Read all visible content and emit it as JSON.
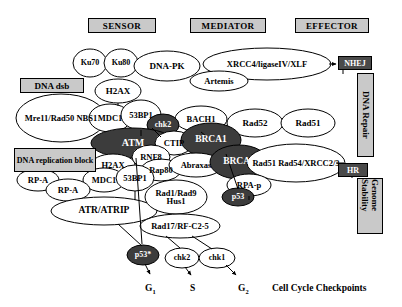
{
  "headers": [
    {
      "id": "sensor",
      "label": "SENSOR",
      "x": 88,
      "y": 18,
      "w": 68,
      "h": 15,
      "fs": 9
    },
    {
      "id": "mediator",
      "label": "MEDIATOR",
      "x": 190,
      "y": 18,
      "w": 76,
      "h": 15,
      "fs": 9
    },
    {
      "id": "effector",
      "label": "EFFECTOR",
      "x": 295,
      "y": 18,
      "w": 74,
      "h": 15,
      "fs": 9
    }
  ],
  "stimulus_boxes": [
    {
      "id": "dna-dsb",
      "label": "DNA dsb",
      "x": 20,
      "y": 78,
      "w": 64,
      "h": 15,
      "fs": 9
    },
    {
      "id": "dna-replication-block",
      "label": "DNA replication block",
      "x": 14,
      "y": 148,
      "w": 82,
      "h": 24,
      "fs": 8
    }
  ],
  "outcome_boxes": [
    {
      "id": "nhej",
      "label": "NHEJ",
      "x": 338,
      "y": 56,
      "w": 34,
      "h": 14,
      "fs": 8,
      "style": "dark"
    },
    {
      "id": "hr",
      "label": "HR",
      "x": 338,
      "y": 163,
      "w": 30,
      "h": 14,
      "fs": 8,
      "style": "dark"
    }
  ],
  "vertical_labels": [
    {
      "id": "dna-repair",
      "label": "DNA Repair",
      "x": 357,
      "y": 73,
      "w": 17,
      "h": 84
    },
    {
      "id": "genome-stability",
      "label": "Genome Stability",
      "x": 357,
      "y": 178,
      "w": 26,
      "h": 56
    }
  ],
  "nodes": [
    {
      "id": "ku70",
      "label": "Ku70",
      "cx": 90,
      "cy": 63,
      "rx": 17,
      "ry": 14,
      "fill": "white",
      "fs": 8
    },
    {
      "id": "ku80",
      "label": "Ku80",
      "cx": 121,
      "cy": 63,
      "rx": 17,
      "ry": 14,
      "fill": "white",
      "fs": 8
    },
    {
      "id": "dna-pk",
      "label": "DNA-PK",
      "cx": 167,
      "cy": 66,
      "rx": 33,
      "ry": 15,
      "fill": "white",
      "fs": 9
    },
    {
      "id": "xrcc4-ligaseiv-xlf",
      "label": "XRCC4/ligaseIV/XLF",
      "cx": 267,
      "cy": 64,
      "rx": 64,
      "ry": 16,
      "fill": "white",
      "fs": 8.5
    },
    {
      "id": "artemis",
      "label": "Artemis",
      "cx": 219,
      "cy": 81,
      "rx": 29,
      "ry": 10,
      "fill": "white",
      "fs": 8.5
    },
    {
      "id": "h2ax-top",
      "label": "H2AX",
      "cx": 118,
      "cy": 91,
      "rx": 23,
      "ry": 12,
      "fill": "white",
      "fs": 9
    },
    {
      "id": "mre11-rad50-nbs1",
      "label": "Mre11/Rad50 NBS1",
      "cx": 61,
      "cy": 118,
      "rx": 45,
      "ry": 24,
      "fill": "white",
      "fs": 8.5
    },
    {
      "id": "mdc1-top",
      "label": "MDC1",
      "cx": 110,
      "cy": 118,
      "rx": 21,
      "ry": 14,
      "fill": "white",
      "fs": 8.5
    },
    {
      "id": "53bp1-top",
      "label": "53BP1",
      "cx": 141,
      "cy": 115,
      "rx": 20,
      "ry": 15,
      "fill": "white",
      "fs": 8.5
    },
    {
      "id": "bach1",
      "label": "BACH1",
      "cx": 201,
      "cy": 119,
      "rx": 26,
      "ry": 13,
      "fill": "white",
      "fs": 8.5
    },
    {
      "id": "rad52",
      "label": "Rad52",
      "cx": 255,
      "cy": 123,
      "rx": 28,
      "ry": 14,
      "fill": "white",
      "fs": 9
    },
    {
      "id": "rad51",
      "label": "Rad51",
      "cx": 308,
      "cy": 123,
      "rx": 27,
      "ry": 14,
      "fill": "white",
      "fs": 9
    },
    {
      "id": "chk2-upper",
      "label": "chk2",
      "cx": 163,
      "cy": 125,
      "rx": 16,
      "ry": 11,
      "fill": "dark",
      "fs": 8
    },
    {
      "id": "atm",
      "label": "ATM",
      "cx": 133,
      "cy": 143,
      "rx": 42,
      "ry": 15,
      "fill": "dark",
      "fs": 10
    },
    {
      "id": "ctip",
      "label": "CTIP",
      "cx": 174,
      "cy": 143,
      "rx": 19,
      "ry": 12,
      "fill": "white",
      "fs": 8.5
    },
    {
      "id": "brca1",
      "label": "BRCA1",
      "cx": 211,
      "cy": 140,
      "rx": 30,
      "ry": 17,
      "fill": "dark",
      "fs": 9.5,
      "underline": true
    },
    {
      "id": "rnf8",
      "label": "RNF8",
      "cx": 151,
      "cy": 157,
      "rx": 19,
      "ry": 12,
      "fill": "white",
      "fs": 8.5
    },
    {
      "id": "rap80",
      "label": "Rap80",
      "cx": 161,
      "cy": 170,
      "rx": 20,
      "ry": 11,
      "fill": "white",
      "fs": 8.5
    },
    {
      "id": "abraxas",
      "label": "Abraxas",
      "cx": 196,
      "cy": 165,
      "rx": 27,
      "ry": 12,
      "fill": "white",
      "fs": 8.5
    },
    {
      "id": "brca2",
      "label": "BRCA2",
      "cx": 239,
      "cy": 162,
      "rx": 29,
      "ry": 17,
      "fill": "dark",
      "fs": 9.5,
      "underline": true
    },
    {
      "id": "rad51-rad54-xrcc23",
      "label": "Rad51 Rad54/XRCC2/3",
      "cx": 296,
      "cy": 163,
      "rx": 49,
      "ry": 19,
      "fill": "white",
      "fs": 8.5
    },
    {
      "id": "h2ax-lower",
      "label": "H2AX",
      "cx": 113,
      "cy": 165,
      "rx": 22,
      "ry": 11,
      "fill": "white",
      "fs": 8.5
    },
    {
      "id": "mdc1-lower",
      "label": "MDC1",
      "cx": 104,
      "cy": 180,
      "rx": 21,
      "ry": 12,
      "fill": "white",
      "fs": 8.5
    },
    {
      "id": "53bp1-lower",
      "label": "53BP1",
      "cx": 135,
      "cy": 178,
      "rx": 19,
      "ry": 13,
      "fill": "white",
      "fs": 8.5
    },
    {
      "id": "rp-a-upper",
      "label": "RP-A",
      "cx": 38,
      "cy": 180,
      "rx": 21,
      "ry": 11,
      "fill": "white",
      "fs": 8.5
    },
    {
      "id": "rp-a-lower",
      "label": "RP-A",
      "cx": 68,
      "cy": 190,
      "rx": 22,
      "ry": 11,
      "fill": "white",
      "fs": 8.5
    },
    {
      "id": "atr-atrip",
      "label": "ATR/ATRIP",
      "cx": 104,
      "cy": 211,
      "rx": 53,
      "ry": 14,
      "fill": "white",
      "fs": 9.5
    },
    {
      "id": "rad1-rad9-hus1",
      "label": "Rad1/Rad9 Hus1",
      "cx": 176,
      "cy": 197,
      "rx": 31,
      "ry": 17,
      "fill": "white",
      "fs": 8.5
    },
    {
      "id": "rpa-p",
      "label": "RPA-p",
      "cx": 249,
      "cy": 185,
      "rx": 22,
      "ry": 11,
      "fill": "white",
      "fs": 8.5
    },
    {
      "id": "p53-right",
      "label": "p53",
      "cx": 238,
      "cy": 197,
      "rx": 16,
      "ry": 9,
      "fill": "dark",
      "fs": 8
    },
    {
      "id": "rad17-rfc25",
      "label": "Rad17/RF-C2-5",
      "cx": 180,
      "cy": 226,
      "rx": 40,
      "ry": 12,
      "fill": "white",
      "fs": 8.5
    },
    {
      "id": "p53-star",
      "label": "p53*",
      "cx": 143,
      "cy": 255,
      "rx": 16,
      "ry": 10,
      "fill": "dark",
      "fs": 8
    },
    {
      "id": "chk2-bottom",
      "label": "chk2",
      "cx": 182,
      "cy": 258,
      "rx": 17,
      "ry": 10,
      "fill": "white",
      "fs": 8
    },
    {
      "id": "chk1",
      "label": "chk1",
      "cx": 217,
      "cy": 258,
      "rx": 18,
      "ry": 10,
      "fill": "white",
      "fs": 8
    }
  ],
  "phases": [
    {
      "id": "g1",
      "label": "G",
      "sub": "1",
      "x": 145,
      "y": 283,
      "fs": 9.5
    },
    {
      "id": "s",
      "label": "S",
      "sub": "",
      "x": 190,
      "y": 283,
      "fs": 9.5
    },
    {
      "id": "g2",
      "label": "G",
      "sub": "2",
      "x": 238,
      "y": 283,
      "fs": 9.5
    }
  ],
  "caption": {
    "id": "cell-cycle-checkpoints",
    "label": "Cell Cycle Checkpoints",
    "x": 272,
    "y": 283,
    "fs": 9.5
  },
  "colors": {
    "dark_fill": "#3c3c3c",
    "light_fill": "#ffffff",
    "box_fill": "#c9c9c9",
    "dark_box_fill": "#4a4a4a",
    "stroke": "#000000"
  },
  "edges": [
    {
      "id": "nhej-arrow",
      "from": "xrcc4-ligaseiv-xlf",
      "to": "nhej"
    },
    {
      "id": "hr-arrow",
      "from": "rad51-rad54-xrcc23",
      "to": "hr"
    },
    {
      "id": "atm-to-p53star",
      "from": "atm",
      "to": "p53-star"
    },
    {
      "id": "atr-to-p53star",
      "from": "atr-atrip",
      "to": "p53-star"
    },
    {
      "id": "p53star-to-g1",
      "from": "p53-star",
      "to": "g1"
    },
    {
      "id": "chk2-to-s",
      "from": "chk2-bottom",
      "to": "s"
    },
    {
      "id": "chk1-to-g2",
      "from": "chk1",
      "to": "g2"
    },
    {
      "id": "rad17-to-chk2",
      "from": "rad17-rfc25",
      "to": "chk2-bottom"
    },
    {
      "id": "rad17-to-chk1",
      "from": "rad17-rfc25",
      "to": "chk1"
    },
    {
      "id": "brca1-to-p53",
      "from": "brca1",
      "to": "p53-right"
    }
  ]
}
